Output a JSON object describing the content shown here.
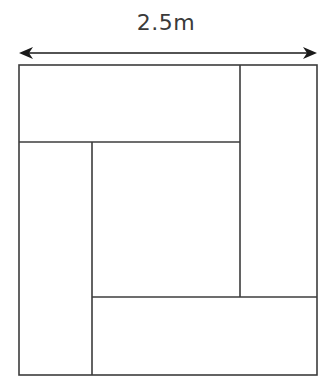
{
  "diagram": {
    "type": "pinwheel-rectangles-in-square",
    "dimension_label": "2.5m",
    "colors": {
      "line": "#3c3c3c",
      "arrow": "#1a1a1a",
      "background": "#ffffff"
    },
    "square": {
      "x": 19,
      "y": 65,
      "size": 298
    },
    "rectangles": [
      {
        "name": "top",
        "x": 19,
        "y": 65,
        "w": 221,
        "h": 77
      },
      {
        "name": "right",
        "x": 240,
        "y": 65,
        "w": 77,
        "h": 232
      },
      {
        "name": "bottom",
        "x": 92,
        "y": 297,
        "w": 225,
        "h": 78
      },
      {
        "name": "left",
        "x": 19,
        "y": 142,
        "w": 73,
        "h": 233
      },
      {
        "name": "center",
        "x": 92,
        "y": 142,
        "w": 148,
        "h": 155
      }
    ]
  }
}
